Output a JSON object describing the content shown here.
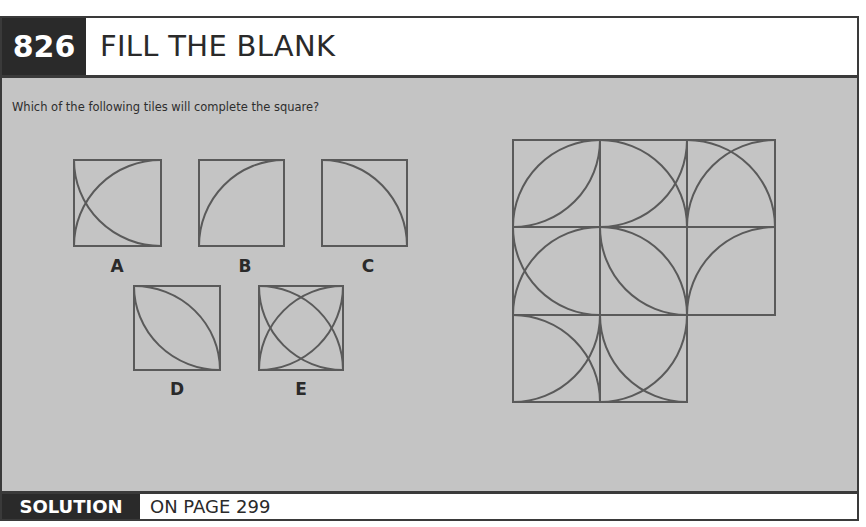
{
  "header": {
    "number": "826",
    "title": "FILL THE BLANK"
  },
  "question": "Which of the following tiles will complete the square?",
  "options": [
    {
      "label": "A",
      "arcs": [
        "BL-center",
        "TR-center-left"
      ]
    },
    {
      "label": "B"
    },
    {
      "label": "C"
    },
    {
      "label": "D"
    },
    {
      "label": "E"
    }
  ],
  "puzzle_grid": {
    "rows": 3,
    "cols": 3,
    "missing": "row3-col3"
  },
  "footer": {
    "solution_label": "SOLUTION",
    "page_text": "ON PAGE 299"
  },
  "colors": {
    "dark": "#2a2a2a",
    "panel": "#c4c4c4",
    "line": "#5a5a5a"
  }
}
